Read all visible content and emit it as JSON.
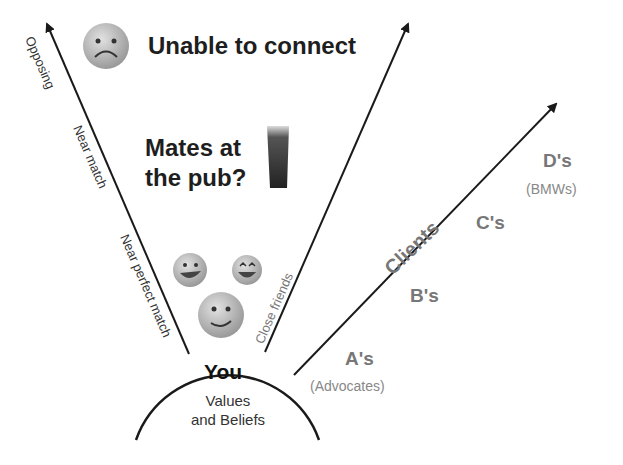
{
  "diagram": {
    "center": {
      "title": "You",
      "subtitle_line1": "Values",
      "subtitle_line2": "and Beliefs"
    },
    "left_axis": {
      "labels": [
        "Opposing",
        "Near match",
        "Near perfect match"
      ]
    },
    "middle_axis": {
      "label": "Close friends"
    },
    "right_axis": {
      "label": "Clients"
    },
    "zones": {
      "unable": {
        "text": "Unable to connect",
        "icon": "sad-face-icon"
      },
      "pub": {
        "line1": "Mates at",
        "line2": "the pub?",
        "icon": "pint-glass-icon"
      },
      "friends": {
        "icons": [
          "grinning-face-icon",
          "beaming-face-icon",
          "smiling-face-icon"
        ]
      }
    },
    "client_tiers": [
      {
        "label": "A's",
        "note": "(Advocates)"
      },
      {
        "label": "B's"
      },
      {
        "label": "C's"
      },
      {
        "label": "D's",
        "note": "(BMWs)"
      }
    ],
    "colors": {
      "line": "#1a1a1a",
      "tier_text": "#777777",
      "face": "#b8b8b8"
    }
  }
}
